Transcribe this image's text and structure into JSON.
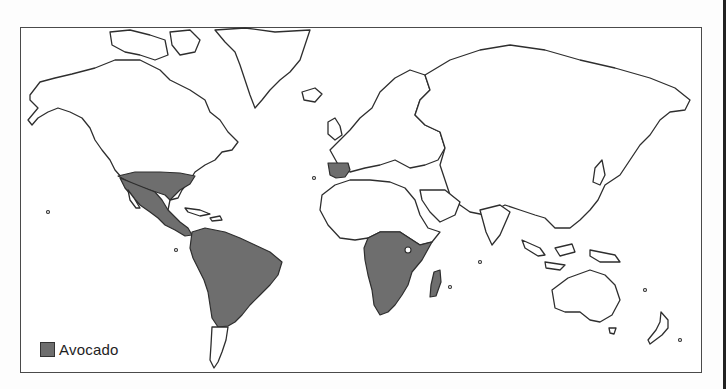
{
  "map": {
    "title": "World map of avocado growing regions",
    "projection": "world outline",
    "shaded_color": "#6e6e6e",
    "outline_color": "#2e2e2e",
    "background": "#ffffff",
    "shaded_regions": [
      "Southern United States",
      "Mexico",
      "Central America",
      "Caribbean",
      "South America (except southern tip)",
      "Iberian Peninsula",
      "Sub-Saharan Africa (central and southern)",
      "Madagascar"
    ]
  },
  "legend": {
    "items": [
      {
        "label": "Avocado",
        "color": "#6e6e6e"
      }
    ]
  }
}
